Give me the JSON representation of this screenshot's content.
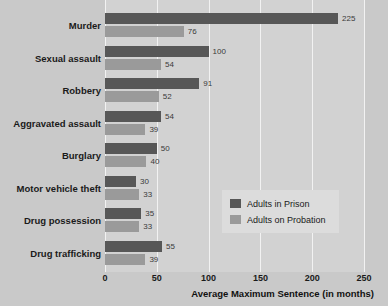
{
  "chart_data": {
    "type": "bar",
    "orientation": "horizontal",
    "title": "",
    "xlabel": "Average Maximum Sentence (in months)",
    "ylabel": "",
    "xlim": [
      0,
      250
    ],
    "xticks": [
      0,
      50,
      100,
      150,
      200,
      250
    ],
    "xtick_labels": [
      "0",
      "50",
      "100",
      "150",
      "200",
      "250"
    ],
    "grid": true,
    "grid_axis": "x",
    "legend_position": "center-right",
    "categories": [
      "Murder",
      "Sexual assault",
      "Robbery",
      "Aggravated assault",
      "Burglary",
      "Motor vehicle theft",
      "Drug possession",
      "Drug trafficking"
    ],
    "series": [
      {
        "name": "Adults in Prison",
        "color": "#575757",
        "values": [
          225,
          100,
          91,
          54,
          50,
          30,
          35,
          55
        ]
      },
      {
        "name": "Adults on Probation",
        "color": "#9a9a9a",
        "values": [
          76,
          54,
          52,
          39,
          40,
          33,
          33,
          39
        ]
      }
    ]
  },
  "legend": {
    "items": [
      {
        "label": "Adults in Prison",
        "color": "#575757"
      },
      {
        "label": "Adults on Probation",
        "color": "#9a9a9a"
      }
    ]
  },
  "colors": {
    "background": "#c9c9c9",
    "plot_background": "#d2d2d2",
    "gridline": "#f2f2f2",
    "prison": "#575757",
    "probation": "#9a9a9a",
    "text": "#1a1a1a"
  }
}
